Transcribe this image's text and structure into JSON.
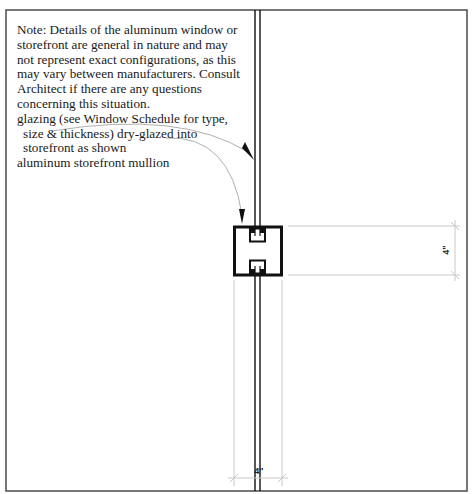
{
  "note": {
    "lines": [
      "Note: Details of the aluminum window or",
      "storefront are general in nature and may",
      "not represent exact configurations, as this",
      "may vary between manufacturers. Consult",
      "Architect if there are any questions",
      "concerning this situation."
    ]
  },
  "callouts": {
    "glazing": [
      "glazing (see Window Schedule for type,",
      "size & thickness) dry-glazed into",
      "storefront as shown"
    ],
    "mullion": "aluminum storefront mullion"
  },
  "dimensions": {
    "vertical": "4\"",
    "horizontal": "4\""
  },
  "colors": {
    "border": "#555555",
    "linework": "#111111",
    "leader": "#b0b0b0",
    "dimension": "#c8c8c8"
  }
}
